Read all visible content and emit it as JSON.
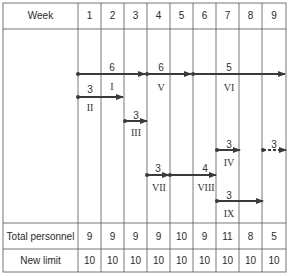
{
  "table": {
    "header_label": "Week",
    "weeks": [
      "1",
      "2",
      "3",
      "4",
      "5",
      "6",
      "7",
      "8",
      "9"
    ],
    "rows": [
      {
        "label": "Total personnel",
        "values": [
          "9",
          "9",
          "9",
          "9",
          "10",
          "9",
          "11",
          "8",
          "5"
        ]
      },
      {
        "label": "New limit",
        "values": [
          "10",
          "10",
          "10",
          "10",
          "10",
          "10",
          "10",
          "10",
          "10"
        ]
      }
    ]
  },
  "activities": [
    {
      "id": "I",
      "personnel": "6",
      "start_week": 1,
      "end_week": 3,
      "dashed": false
    },
    {
      "id": "V",
      "personnel": "6",
      "start_week": 4,
      "end_week": 5,
      "dashed": false
    },
    {
      "id": "VI",
      "personnel": "5",
      "start_week": 6,
      "end_week": 9,
      "dashed": false
    },
    {
      "id": "II",
      "personnel": "3",
      "start_week": 1,
      "end_week": 2,
      "dashed": false
    },
    {
      "id": "III",
      "personnel": "3",
      "start_week": 3,
      "end_week": 3,
      "dashed": false
    },
    {
      "id": "IV",
      "personnel": "3",
      "start_week": 7,
      "end_week": 7,
      "dashed": false
    },
    {
      "id": "IV-cont",
      "personnel": "3",
      "start_week": 9,
      "end_week": 9,
      "dashed": true
    },
    {
      "id": "VII",
      "personnel": "3",
      "start_week": 4,
      "end_week": 4,
      "dashed": false
    },
    {
      "id": "VIII",
      "personnel": "4",
      "start_week": 5,
      "end_week": 6,
      "dashed": false
    },
    {
      "id": "IX",
      "personnel": "3",
      "start_week": 7,
      "end_week": 8,
      "dashed": false
    }
  ],
  "labels": {
    "I": "I",
    "II": "II",
    "III": "III",
    "IV": "IV",
    "V": "V",
    "VI": "VI",
    "VII": "VII",
    "VIII": "VIII",
    "IX": "IX"
  },
  "colors": {
    "line": "#3a3a3a",
    "grid": "#555555"
  }
}
